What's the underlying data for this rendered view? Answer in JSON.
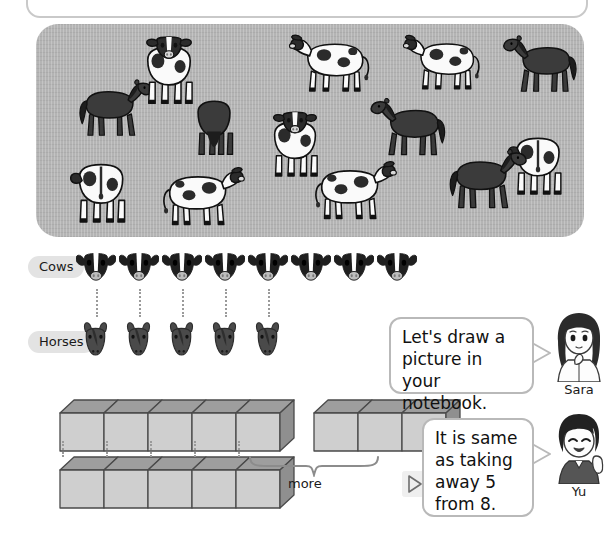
{
  "page": {
    "background_color": "#ffffff"
  },
  "top_panel": {
    "name": "cut-off-rounded-panel",
    "border_color": "#c9c9c9"
  },
  "pasture": {
    "label": "Pasture scene with cows and horses",
    "background_color": "#b4b4b4",
    "cow_count": 8,
    "horse_count": 5,
    "animals": [
      {
        "type": "horse",
        "facing": "right",
        "x": 38,
        "y": 54,
        "w": 82,
        "h": 62
      },
      {
        "type": "cow",
        "facing": "front",
        "x": 100,
        "y": 12,
        "w": 66,
        "h": 72
      },
      {
        "type": "horse",
        "facing": "front",
        "x": 150,
        "y": 72,
        "w": 56,
        "h": 62
      },
      {
        "type": "cow",
        "facing": "front",
        "x": 228,
        "y": 86,
        "w": 62,
        "h": 72
      },
      {
        "type": "cow",
        "facing": "left",
        "x": 252,
        "y": 6,
        "w": 90,
        "h": 68
      },
      {
        "type": "cow",
        "facing": "left",
        "x": 366,
        "y": 6,
        "w": 86,
        "h": 66
      },
      {
        "type": "horse",
        "facing": "left",
        "x": 464,
        "y": 10,
        "w": 82,
        "h": 62
      },
      {
        "type": "horse",
        "facing": "left",
        "x": 330,
        "y": 74,
        "w": 86,
        "h": 60
      },
      {
        "type": "cow",
        "facing": "back",
        "x": 470,
        "y": 100,
        "w": 64,
        "h": 78
      },
      {
        "type": "cow",
        "facing": "back",
        "x": 32,
        "y": 128,
        "w": 66,
        "h": 76
      },
      {
        "type": "cow",
        "facing": "right",
        "x": 118,
        "y": 140,
        "w": 92,
        "h": 66
      },
      {
        "type": "cow",
        "facing": "right",
        "x": 270,
        "y": 134,
        "w": 92,
        "h": 66
      },
      {
        "type": "horse",
        "facing": "right",
        "x": 408,
        "y": 120,
        "w": 86,
        "h": 72
      }
    ]
  },
  "tally": {
    "rows": [
      {
        "label": "Cows",
        "icon": "cow-head-icon",
        "count": 8
      },
      {
        "label": "Horses",
        "icon": "horse-head-icon",
        "count": 5
      }
    ],
    "connector_count": 5,
    "label_background": "#e3e3e3"
  },
  "blocks": {
    "top_row_count": 8,
    "top_row_groups": [
      5,
      3
    ],
    "bottom_row_count": 5,
    "connector_count": 5,
    "brace_label": "more",
    "block_face_color": "#cfcfcf",
    "block_top_color": "#9e9e9e",
    "block_side_color": "#8f8f8f"
  },
  "play_marker": {
    "name": "play-triangle-marker",
    "glyph": "▷"
  },
  "speech": [
    {
      "speaker": "Sara",
      "lines": [
        "Let's draw a",
        "picture in your",
        "notebook."
      ],
      "avatar": "girl-thinking-avatar"
    },
    {
      "speaker": "Yu",
      "lines": [
        "It is same",
        "as taking",
        "away 5",
        "from 8."
      ],
      "avatar": "boy-smiling-avatar"
    }
  ]
}
